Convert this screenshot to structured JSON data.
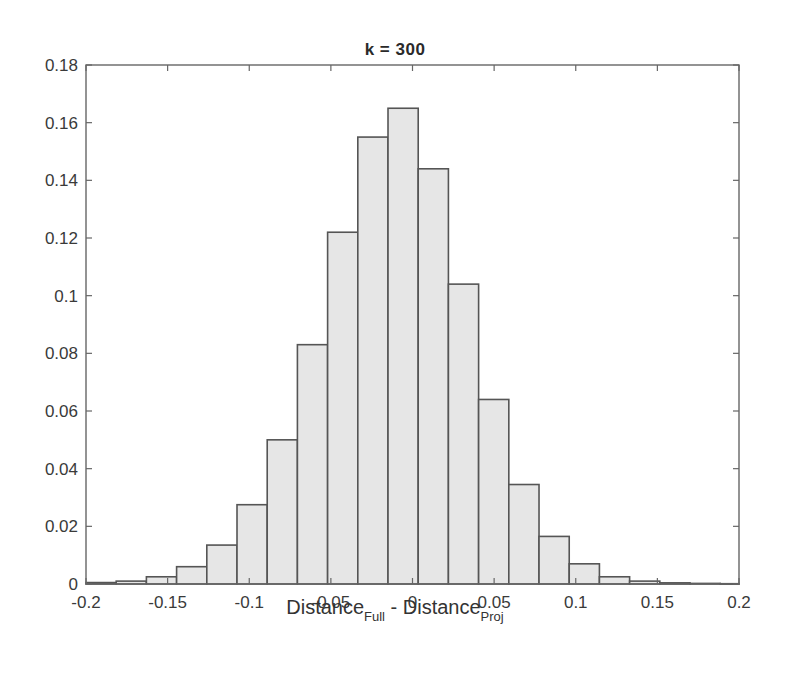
{
  "chart_data": {
    "type": "bar",
    "subtype": "histogram",
    "title": "k = 300",
    "xlabel": {
      "main_1": "Distance",
      "sub_1": "Full",
      "sep": " - ",
      "main_2": "Distance",
      "sub_2": "Proj"
    },
    "ylabel": "",
    "xlim": [
      -0.2,
      0.2
    ],
    "ylim": [
      0,
      0.18
    ],
    "xticks": [
      -0.2,
      -0.15,
      -0.1,
      -0.05,
      0,
      0.05,
      0.1,
      0.15,
      0.2
    ],
    "xtick_labels": [
      "-0.2",
      "-0.15",
      "-0.1",
      "-0.05",
      "0",
      "0.05",
      "0.1",
      "0.15",
      "0.2"
    ],
    "yticks": [
      0,
      0.02,
      0.04,
      0.06,
      0.08,
      0.1,
      0.12,
      0.14,
      0.16,
      0.18
    ],
    "ytick_labels": [
      "0",
      "0.02",
      "0.04",
      "0.06",
      "0.08",
      "0.1",
      "0.12",
      "0.14",
      "0.16",
      "0.18"
    ],
    "grid": false,
    "legend": null,
    "bin_edges": [
      -0.2,
      -0.1815,
      -0.163,
      -0.1445,
      -0.126,
      -0.1075,
      -0.089,
      -0.0705,
      -0.052,
      -0.0335,
      -0.015,
      0.0035,
      0.022,
      0.0405,
      0.059,
      0.0775,
      0.096,
      0.1145,
      0.133,
      0.1515,
      0.17,
      0.1885,
      0.2
    ],
    "values": [
      0.0005,
      0.001,
      0.0025,
      0.006,
      0.0135,
      0.0275,
      0.05,
      0.083,
      0.122,
      0.155,
      0.165,
      0.144,
      0.104,
      0.064,
      0.0345,
      0.0165,
      0.007,
      0.0025,
      0.001,
      0.0004,
      0.0002,
      0.0001
    ],
    "bar_fill": "#e6e6e6",
    "bar_edge": "#555555",
    "axis_color": "#666666"
  }
}
